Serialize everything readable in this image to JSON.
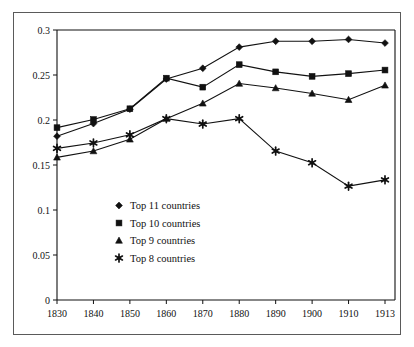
{
  "chart_data": {
    "type": "line",
    "title": "",
    "subtitle": "",
    "xlabel": "",
    "ylabel": "",
    "x": [
      1830,
      1840,
      1850,
      1860,
      1870,
      1880,
      1890,
      1900,
      1910,
      1913
    ],
    "xtick_labels": [
      "1830",
      "1840",
      "1850",
      "1860",
      "1870",
      "1880",
      "1890",
      "1900",
      "1910",
      "1913"
    ],
    "ytick_labels": [
      "0",
      "0.05",
      "0.1",
      "0.15",
      "0.2",
      "0.25",
      "0.3"
    ],
    "ytick_values": [
      0,
      0.05,
      0.1,
      0.15,
      0.2,
      0.25,
      0.3
    ],
    "ylim": [
      0,
      0.3
    ],
    "grid": false,
    "legend_position": "center-left-inside",
    "series": [
      {
        "name": "Top 11 countries",
        "marker": "diamond",
        "color": "#111111",
        "values": [
          0.182,
          0.196,
          0.212,
          0.2455,
          0.2575,
          0.281,
          0.2875,
          0.2875,
          0.2895,
          0.2855
        ]
      },
      {
        "name": "Top 10 countries",
        "marker": "square",
        "color": "#111111",
        "values": [
          0.1915,
          0.2005,
          0.2125,
          0.2465,
          0.2365,
          0.2615,
          0.2535,
          0.2485,
          0.2515,
          0.2555
        ]
      },
      {
        "name": "Top 9 countries",
        "marker": "triangle",
        "color": "#111111",
        "values": [
          0.1585,
          0.1655,
          0.1785,
          0.2015,
          0.2185,
          0.2405,
          0.2355,
          0.2295,
          0.2225,
          0.2385
        ]
      },
      {
        "name": "Top 8 countries",
        "marker": "asterisk",
        "color": "#111111",
        "values": [
          0.1685,
          0.1745,
          0.1835,
          0.2015,
          0.1955,
          0.2015,
          0.1655,
          0.1525,
          0.1265,
          0.1335
        ]
      }
    ]
  },
  "legend": {
    "entries": [
      {
        "label": "Top 11 countries",
        "marker": "diamond"
      },
      {
        "label": "Top 10 countries",
        "marker": "square"
      },
      {
        "label": "Top 9 countries",
        "marker": "triangle"
      },
      {
        "label": "Top 8 countries",
        "marker": "asterisk"
      }
    ]
  }
}
